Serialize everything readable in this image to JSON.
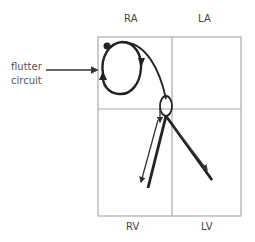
{
  "diagram": {
    "chambers": {
      "ra": "RA",
      "la": "LA",
      "rv": "RV",
      "lv": "LV"
    },
    "annotation": {
      "line1": "flutter",
      "line2": "circuit"
    },
    "colors": {
      "stroke": "#333333",
      "grid": "#aaaaaa",
      "text": "#444444"
    }
  }
}
